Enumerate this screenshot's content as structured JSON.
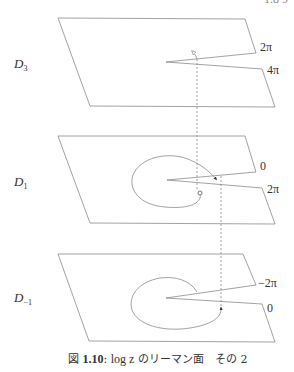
{
  "header": {
    "text": "1.8 9"
  },
  "planes": [
    {
      "name": "D",
      "subscript": "3",
      "labels": {
        "upper": "2π",
        "lower": "4π"
      }
    },
    {
      "name": "D",
      "subscript": "1",
      "labels": {
        "upper": "0",
        "lower": "2π"
      }
    },
    {
      "name": "D",
      "subscript": "−1",
      "labels": {
        "upper": "−2π",
        "lower": "0"
      }
    }
  ],
  "caption": {
    "fig": "図",
    "number": "1.10",
    "colon": ":",
    "math": "log z",
    "text": "のリーマン面　その 2"
  },
  "colors": {
    "line": "#8a8a8a",
    "text": "#333333"
  }
}
